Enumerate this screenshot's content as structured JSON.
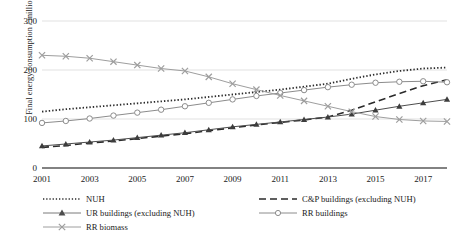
{
  "chart_data": {
    "type": "line",
    "title": "",
    "xlabel": "",
    "ylabel": "Final energy consumption / million TCE",
    "x": [
      2001,
      2002,
      2003,
      2004,
      2005,
      2006,
      2007,
      2008,
      2009,
      2010,
      2011,
      2012,
      2013,
      2014,
      2015,
      2016,
      2017,
      2018
    ],
    "xticks": [
      "2001",
      "2003",
      "2005",
      "2007",
      "2009",
      "2011",
      "2013",
      "2015",
      "2017"
    ],
    "xtick_values": [
      2001,
      2003,
      2005,
      2007,
      2009,
      2011,
      2013,
      2015,
      2017
    ],
    "yticks": [
      "0",
      "100",
      "200",
      "300"
    ],
    "ytick_values": [
      0,
      100,
      200,
      300
    ],
    "ylim": [
      0,
      300
    ],
    "xlim": [
      2001,
      2018
    ],
    "grid": true,
    "legend_position": "bottom",
    "series": [
      {
        "name": "NUH",
        "style": "dotted",
        "marker": "none",
        "color": "#2b2b2b",
        "values": [
          115,
          120,
          124,
          128,
          132,
          136,
          140,
          145,
          150,
          155,
          160,
          166,
          172,
          182,
          191,
          198,
          203,
          205
        ]
      },
      {
        "name": "C&P buildings (excluding NUH)",
        "style": "dashed",
        "marker": "none",
        "color": "#2b2b2b",
        "values": [
          42,
          46,
          51,
          55,
          60,
          65,
          70,
          76,
          82,
          88,
          93,
          98,
          104,
          118,
          135,
          152,
          168,
          180
        ]
      },
      {
        "name": "UR buildings (excluding NUH)",
        "style": "solid",
        "marker": "triangle",
        "color": "#4d4d4d",
        "values": [
          45,
          49,
          53,
          57,
          62,
          67,
          72,
          78,
          84,
          89,
          94,
          99,
          104,
          110,
          118,
          126,
          133,
          140
        ]
      },
      {
        "name": "RR buildings",
        "style": "solid",
        "marker": "circle",
        "color": "#8c8c8c",
        "values": [
          92,
          96,
          101,
          107,
          113,
          119,
          126,
          133,
          140,
          147,
          153,
          159,
          165,
          170,
          174,
          176,
          177,
          175
        ]
      },
      {
        "name": "RR biomass",
        "style": "solid",
        "marker": "cross",
        "color": "#9e9e9e",
        "values": [
          230,
          228,
          224,
          217,
          210,
          203,
          198,
          186,
          172,
          160,
          148,
          137,
          126,
          115,
          105,
          99,
          96,
          95
        ]
      }
    ]
  },
  "legend": {
    "items": [
      {
        "label": "NUH",
        "key": "dotted-line-key"
      },
      {
        "label": "C&P buildings (excluding NUH)",
        "key": "dashed-line-key"
      },
      {
        "label": "UR buildings (excluding NUH)",
        "key": "triangle-marker-key"
      },
      {
        "label": "RR buildings",
        "key": "circle-marker-key"
      },
      {
        "label": "RR biomass",
        "key": "cross-marker-key"
      }
    ]
  },
  "colors": {
    "gridline": "#d9d9d9",
    "axis": "#595959",
    "text": "#1a1a1a"
  }
}
